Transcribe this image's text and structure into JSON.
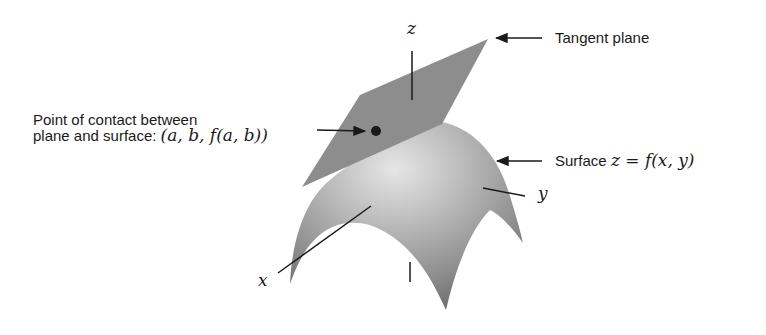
{
  "figure": {
    "labels": {
      "tangent_plane": "Tangent plane",
      "surface_prefix": "Surface",
      "surface_eq": "z = f(x, y)",
      "contact_line1": "Point of contact between",
      "contact_line2_prefix": "plane and surface:",
      "contact_point": "(a, b, f(a, b))",
      "axis_x": "x",
      "axis_y": "y",
      "axis_z": "z"
    },
    "colors": {
      "plane": "#8a8a8a",
      "surface_light": "#d8d8d8",
      "surface_dark": "#6e6e6e",
      "ink": "#1a1a1a"
    }
  }
}
